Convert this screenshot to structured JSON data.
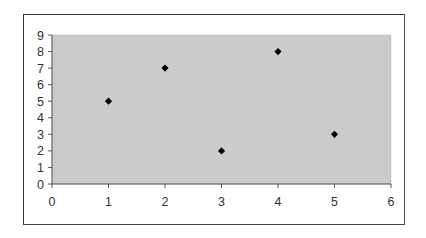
{
  "chart_data": {
    "type": "scatter",
    "title": "",
    "xlabel": "",
    "ylabel": "",
    "x": [
      1,
      2,
      3,
      4,
      5
    ],
    "y": [
      5,
      7,
      2,
      8,
      3
    ],
    "series": [
      {
        "name": "Series 1",
        "marker": "diamond",
        "color": "#000000",
        "points": [
          [
            1,
            5
          ],
          [
            2,
            7
          ],
          [
            3,
            2
          ],
          [
            4,
            8
          ],
          [
            5,
            3
          ]
        ]
      }
    ],
    "xlim": [
      0,
      6
    ],
    "ylim": [
      0,
      9
    ],
    "xticks": [
      "0",
      "1",
      "2",
      "3",
      "4",
      "5",
      "6"
    ],
    "yticks": [
      "0",
      "1",
      "2",
      "3",
      "4",
      "5",
      "6",
      "7",
      "8",
      "9"
    ],
    "grid": false,
    "legend": "none",
    "plot_background": "#cbcbcb"
  }
}
